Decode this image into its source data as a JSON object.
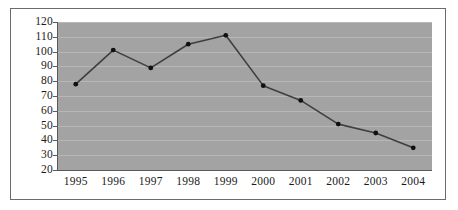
{
  "chart_data": {
    "type": "line",
    "title": "",
    "subtitle": "",
    "xlabel": "",
    "ylabel": "",
    "categories": [
      "1995",
      "1996",
      "1997",
      "1998",
      "1999",
      "2000",
      "2001",
      "2002",
      "2003",
      "2004"
    ],
    "values": [
      78,
      101,
      89,
      105,
      111,
      77,
      67,
      51,
      45,
      35
    ],
    "series": [
      {
        "name": "",
        "values": [
          78,
          101,
          89,
          105,
          111,
          77,
          67,
          51,
          45,
          35
        ]
      }
    ],
    "ylim": [
      20,
      120
    ],
    "y_ticks": [
      20,
      30,
      40,
      50,
      60,
      70,
      80,
      90,
      100,
      110,
      120
    ],
    "y_tick_labels": [
      "20",
      "30",
      "40",
      "50",
      "60",
      "70",
      "80",
      "90",
      "100",
      "110",
      "120"
    ],
    "x_tick_labels": [
      "1995",
      "1996",
      "1997",
      "1998",
      "1999",
      "2000",
      "2001",
      "2002",
      "2003",
      "2004"
    ],
    "grid": "horizontal",
    "legend": "none",
    "markers": "filled-circle",
    "annotations": [],
    "colors": {
      "plot_background": "#a3a3a3",
      "figure_background": "#ffffff",
      "gridline": "#b7b7b7",
      "line": "#3f3f3f",
      "marker": "#101010",
      "axis": "#5a5a5a",
      "border": "#6b6b6b",
      "tick_text": "#1a1a1a"
    }
  }
}
